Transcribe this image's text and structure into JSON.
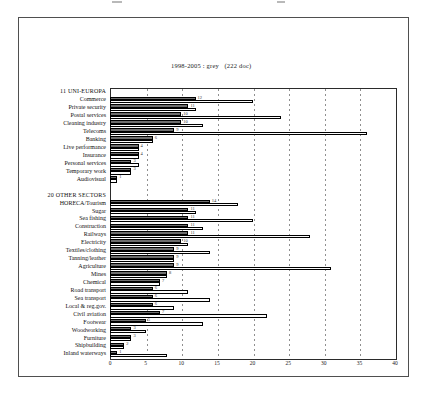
{
  "legend": {
    "line1": "1998-2005 : grey   (222 doc)",
    "line2": "1978-2005 : white   (385 doc)"
  },
  "chart_data": {
    "type": "bar",
    "orientation": "horizontal",
    "title": "",
    "xlabel": "",
    "ylabel": "",
    "xlim": [
      0,
      40
    ],
    "xticks": [
      0,
      5,
      10,
      15,
      20,
      25,
      30,
      35,
      40
    ],
    "grid": "dashed-vertical",
    "series": [
      {
        "name": "1998-2005 : grey (222 doc)",
        "color": "#6e6e6e"
      },
      {
        "name": "1978-2005 : white (385 doc)",
        "color": "#fcfcfc"
      }
    ],
    "sections": [
      {
        "header": "11 UNI-EUROPA",
        "rows": [
          {
            "label": "Commerce",
            "grey": 12,
            "white": 20
          },
          {
            "label": "Private security",
            "grey": 11,
            "white": 12
          },
          {
            "label": "Postal services",
            "grey": 10,
            "white": 24
          },
          {
            "label": "Cleaning industry",
            "grey": 10,
            "white": 13
          },
          {
            "label": "Telecoms",
            "grey": 9,
            "white": 36
          },
          {
            "label": "Banking",
            "grey": 6,
            "white": 6
          },
          {
            "label": "Live performance",
            "grey": 4,
            "white": 4
          },
          {
            "label": "Insurance",
            "grey": 4,
            "white": 4
          },
          {
            "label": "Personal services",
            "grey": 3,
            "white": 4
          },
          {
            "label": "Temporary work",
            "grey": 3,
            "white": 3
          },
          {
            "label": "Audiovisual",
            "grey": 1,
            "white": 1
          }
        ]
      },
      {
        "header": "20 OTHER SECTORS",
        "rows": [
          {
            "label": "HORECA/Tourism",
            "grey": 14,
            "white": 18
          },
          {
            "label": "Sugar",
            "grey": 11,
            "white": 12
          },
          {
            "label": "Sea fishing",
            "grey": 11,
            "white": 20
          },
          {
            "label": "Construction",
            "grey": 11,
            "white": 13
          },
          {
            "label": "Railways",
            "grey": 11,
            "white": 28
          },
          {
            "label": "Electricity",
            "grey": 10,
            "white": 11
          },
          {
            "label": "Textiles/clothing",
            "grey": 9,
            "white": 14
          },
          {
            "label": "Tanning/leather",
            "grey": 9,
            "white": 9
          },
          {
            "label": "Agriculture",
            "grey": 9,
            "white": 31
          },
          {
            "label": "Mines",
            "grey": 8,
            "white": 8
          },
          {
            "label": "Chemical",
            "grey": 7,
            "white": 7
          },
          {
            "label": "Road transport",
            "grey": 6,
            "white": 11
          },
          {
            "label": "Sea transport",
            "grey": 6,
            "white": 14
          },
          {
            "label": "Local & reg.gov.",
            "grey": 6,
            "white": 9
          },
          {
            "label": "Civil aviation",
            "grey": 7,
            "white": 22
          },
          {
            "label": "Footwear",
            "grey": 5,
            "white": 13
          },
          {
            "label": "Woodworking",
            "grey": 3,
            "white": 5
          },
          {
            "label": "Furniture",
            "grey": 3,
            "white": 3
          },
          {
            "label": "Shipbuilding",
            "grey": 2,
            "white": 2
          },
          {
            "label": "Inland waterways",
            "grey": 1,
            "white": 8
          }
        ]
      }
    ]
  }
}
